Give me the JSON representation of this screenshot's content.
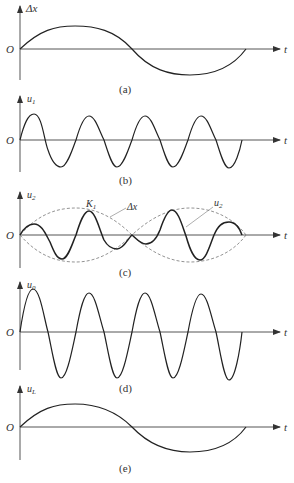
{
  "figure": {
    "panels": [
      {
        "id": "a",
        "ylabel": "Δx",
        "origin": "O",
        "xlabel": "t",
        "caption": "(a)",
        "curve": "one-period sine, slow"
      },
      {
        "id": "b",
        "ylabel": "u",
        "ylabel_sub": "1",
        "origin": "O",
        "xlabel": "t",
        "caption": "(b)",
        "curve": "four-cycle carrier sine"
      },
      {
        "id": "c",
        "ylabel": "u",
        "ylabel_sub": "2",
        "origin": "O",
        "xlabel": "t",
        "caption": "(c)",
        "curve": "amplitude-modulated carrier with Δx envelope",
        "annotations": {
          "k_label": "K",
          "k_sub": "1",
          "envelope_label": "Δx",
          "signal_label": "u",
          "signal_sub": "2"
        }
      },
      {
        "id": "d",
        "ylabel": "u",
        "ylabel_sub": "0",
        "origin": "O",
        "xlabel": "t",
        "caption": "(d)",
        "curve": "four-cycle sine, large amplitude"
      },
      {
        "id": "e",
        "ylabel": "u",
        "ylabel_sub": "L",
        "origin": "O",
        "xlabel": "t",
        "caption": "(e)",
        "curve": "one-period sine, slow"
      }
    ]
  }
}
